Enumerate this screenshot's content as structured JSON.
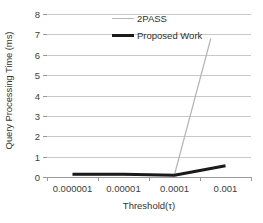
{
  "chart_data": {
    "type": "line",
    "title": "",
    "xlabel": "Threshold(τ)",
    "ylabel": "Query Processing Time (ms)",
    "categories": [
      "0.000001",
      "0.00001",
      "0.0001",
      "0.001"
    ],
    "ylim": [
      0,
      8
    ],
    "yticks": [
      0,
      1,
      2,
      3,
      4,
      5,
      6,
      7,
      8
    ],
    "grid": true,
    "legend_position": "inside-top-center",
    "series": [
      {
        "name": "2PASS",
        "values": [
          0.1,
          0.1,
          0.12,
          9.5
        ],
        "clipped_at": 6.8,
        "color": "#b6b6b6",
        "width": 1.3
      },
      {
        "name": "Proposed Work",
        "values": [
          0.13,
          0.13,
          0.09,
          0.55
        ],
        "color": "#1a1a1a",
        "width": 3.0
      }
    ]
  },
  "axes": {
    "y_title": "Query Processing Time (ms)",
    "x_title": "Threshold(τ)",
    "y_tick_labels": [
      "0",
      "1",
      "2",
      "3",
      "4",
      "5",
      "6",
      "7",
      "8"
    ],
    "x_tick_labels": [
      "0.000001",
      "0.00001",
      "0.0001",
      "0.001"
    ]
  },
  "legend": {
    "items": [
      {
        "label": "2PASS"
      },
      {
        "label": "Proposed Work"
      }
    ]
  },
  "colors": {
    "grid": "#c9c9c9",
    "axis": "#9a9a9a",
    "series_2pass": "#b6b6b6",
    "series_proposed": "#1a1a1a",
    "background": "#ffffff"
  }
}
